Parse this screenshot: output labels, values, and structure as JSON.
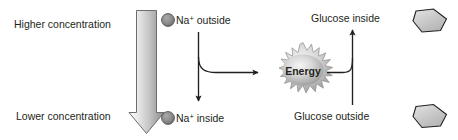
{
  "diagram": {
    "colors": {
      "text": "#231f20",
      "arrow_stroke": "#231f20",
      "gradient_arrow_light": "#f2f2f2",
      "gradient_arrow_dark": "#8e8e8e",
      "gradient_arrow_border": "#6d6d6d",
      "ion_fill": "#8a8a8a",
      "ion_border": "#4a4a4a",
      "energy_fill_light": "#efefef",
      "energy_fill_dark": "#9a9a9a",
      "energy_border": "#7a7a7a",
      "hexagon_fill": "#c9c9c9",
      "hexagon_border": "#231f20"
    },
    "labels": {
      "higher_concentration": "Higher concentration",
      "lower_concentration": "Lower concentration",
      "na_outside_prefix": "Na",
      "na_outside_charge": "+",
      "na_outside_suffix": " outside",
      "na_inside_prefix": "Na",
      "na_inside_charge": "+",
      "na_inside_suffix": " inside",
      "glucose_inside": "Glucose inside",
      "glucose_outside": "Glucose outside",
      "energy": "Energy"
    },
    "shapes": {
      "concentration_gradient_arrow": "large downward gradient arrow",
      "na_outside_ion": "gray circle",
      "na_inside_ion": "gray circle",
      "energy_burst": "starburst",
      "glucose_inside_hexagon": "gray hexagon",
      "glucose_outside_hexagon": "gray hexagon"
    },
    "arrows": {
      "sodium_downward": "Na+ outside to Na+ inside",
      "sodium_to_energy": "Na+ gradient branch to Energy",
      "energy_to_glucose": "Energy branch to glucose transport",
      "glucose_upward": "Glucose outside to Glucose inside"
    }
  }
}
